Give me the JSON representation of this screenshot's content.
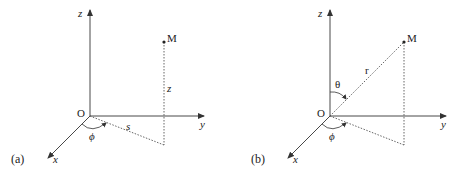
{
  "panels": [
    {
      "id": "a",
      "caption": "(a)",
      "title": "Cylindrical coordinates",
      "labels": {
        "z_axis": "z",
        "y_axis": "y",
        "x_axis": "x",
        "origin": "O",
        "point": "M",
        "height": "z",
        "radial": "s",
        "azimuth": "ϕ"
      }
    },
    {
      "id": "b",
      "caption": "(b)",
      "title": "Spherical coordinates",
      "labels": {
        "z_axis": "z",
        "y_axis": "y",
        "x_axis": "x",
        "origin": "O",
        "point": "M",
        "radius": "r",
        "polar": "θ",
        "azimuth": "ϕ"
      }
    }
  ],
  "colors": {
    "line": "#333333",
    "dotted": "#555555",
    "background": "#ffffff"
  }
}
